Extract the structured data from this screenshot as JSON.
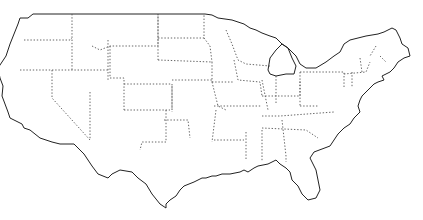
{
  "map": {
    "subject": "Contiguous United States outline map",
    "style": "blank outline with dotted state borders",
    "colors": {
      "background": "#ffffff",
      "outline": "#222222",
      "state_borders": "#555555"
    },
    "labels": []
  }
}
